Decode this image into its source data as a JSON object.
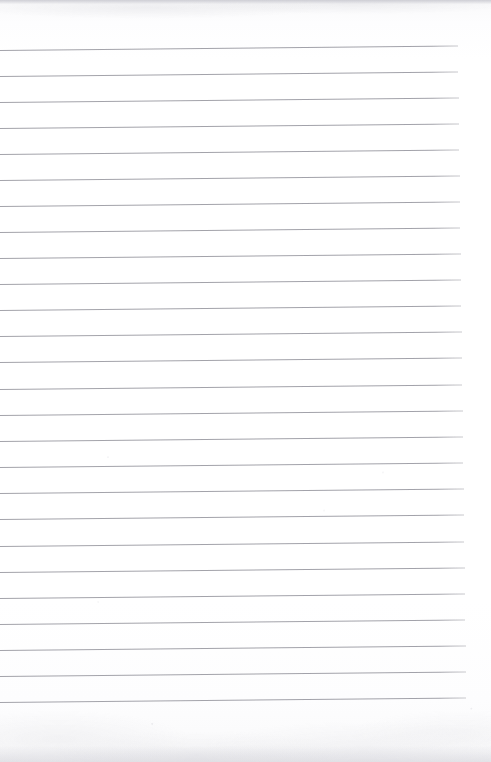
{
  "document": {
    "kind": "scanned-lined-paper",
    "title": "Blank ruled notebook page",
    "description": "A scanned blank sheet of ruled writing paper with no handwriting or printed text.",
    "page_width": 491,
    "page_height": 762,
    "visible_text": "",
    "colors": {
      "paper": "#fdfdfe",
      "rule_line": "#9b9ba3",
      "scan_edge_shadow": "#c4c4cc"
    }
  },
  "ruling": {
    "line_count": 26,
    "first_line_y": 50,
    "last_line_y": 702,
    "line_spacing_px": 26,
    "line_thickness_px": 1,
    "line_start_x": 0,
    "line_end_x_top": 458,
    "line_end_x_bottom": 466,
    "skew_degrees": -0.55,
    "lines": [
      {
        "index": 1,
        "y": 50,
        "length": 458
      },
      {
        "index": 2,
        "y": 76,
        "length": 458
      },
      {
        "index": 3,
        "y": 102,
        "length": 459
      },
      {
        "index": 4,
        "y": 128,
        "length": 459
      },
      {
        "index": 5,
        "y": 154,
        "length": 459
      },
      {
        "index": 6,
        "y": 180,
        "length": 460
      },
      {
        "index": 7,
        "y": 206,
        "length": 460
      },
      {
        "index": 8,
        "y": 232,
        "length": 460
      },
      {
        "index": 9,
        "y": 258,
        "length": 461
      },
      {
        "index": 10,
        "y": 284,
        "length": 461
      },
      {
        "index": 11,
        "y": 310,
        "length": 461
      },
      {
        "index": 12,
        "y": 336,
        "length": 462
      },
      {
        "index": 13,
        "y": 362,
        "length": 462
      },
      {
        "index": 14,
        "y": 389,
        "length": 462
      },
      {
        "index": 15,
        "y": 415,
        "length": 463
      },
      {
        "index": 16,
        "y": 441,
        "length": 463
      },
      {
        "index": 17,
        "y": 467,
        "length": 463
      },
      {
        "index": 18,
        "y": 493,
        "length": 464
      },
      {
        "index": 19,
        "y": 519,
        "length": 464
      },
      {
        "index": 20,
        "y": 546,
        "length": 464
      },
      {
        "index": 21,
        "y": 572,
        "length": 465
      },
      {
        "index": 22,
        "y": 598,
        "length": 465
      },
      {
        "index": 23,
        "y": 624,
        "length": 465
      },
      {
        "index": 24,
        "y": 650,
        "length": 466
      },
      {
        "index": 25,
        "y": 676,
        "length": 466
      },
      {
        "index": 26,
        "y": 702,
        "length": 466
      }
    ]
  },
  "margins": {
    "top_blank_px": 50,
    "bottom_blank_px": 60,
    "right_blank_px": 25
  }
}
